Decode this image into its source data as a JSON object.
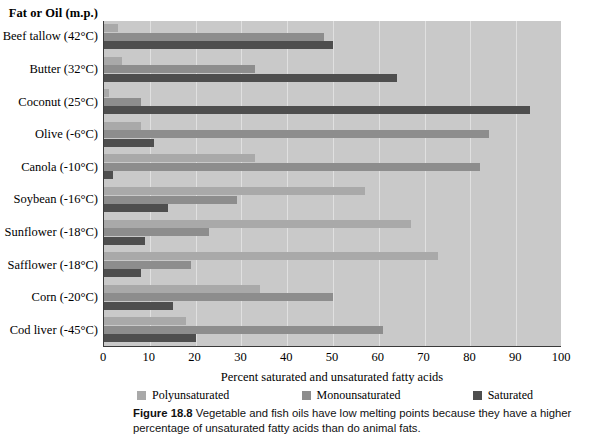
{
  "header": {
    "y_axis_header": "Fat or Oil (m.p.)"
  },
  "caption": {
    "figure_number": "Figure 18.8",
    "text": "Vegetable and fish oils have low melting points because they have a higher percentage of unsaturated fatty acids than do animal fats."
  },
  "legend": {
    "items": [
      {
        "label": "Polyunsaturated",
        "color": "#a9a9a9",
        "swatch": "poly"
      },
      {
        "label": "Monounsaturated",
        "color": "#8d8d8d",
        "swatch": "mono"
      },
      {
        "label": "Saturated",
        "color": "#4e4e4e",
        "swatch": "sat"
      }
    ]
  },
  "chart_data": {
    "type": "bar",
    "orientation": "horizontal",
    "title": "",
    "xlabel": "Percent saturated and unsaturated fatty acids",
    "ylabel": "Fat or Oil (m.p.)",
    "xlim": [
      0,
      100
    ],
    "xticks": [
      0,
      10,
      20,
      30,
      40,
      50,
      60,
      70,
      80,
      90,
      100
    ],
    "grid": true,
    "legend_position": "bottom",
    "categories": [
      "Beef tallow (42°C)",
      "Butter (32°C)",
      "Coconut (25°C)",
      "Olive (-6°C)",
      "Canola (-10°C)",
      "Soybean (-16°C)",
      "Sunflower (-18°C)",
      "Safflower (-18°C)",
      "Corn (-20°C)",
      "Cod liver (-45°C)"
    ],
    "series": [
      {
        "name": "Polyunsaturated",
        "color": "#a9a9a9",
        "values": [
          3,
          4,
          1,
          8,
          33,
          57,
          67,
          73,
          34,
          18
        ]
      },
      {
        "name": "Monounsaturated",
        "color": "#8d8d8d",
        "values": [
          48,
          33,
          8,
          84,
          82,
          29,
          23,
          19,
          50,
          61
        ]
      },
      {
        "name": "Saturated",
        "color": "#4e4e4e",
        "values": [
          50,
          64,
          93,
          11,
          2,
          14,
          9,
          8,
          15,
          20
        ]
      }
    ]
  }
}
